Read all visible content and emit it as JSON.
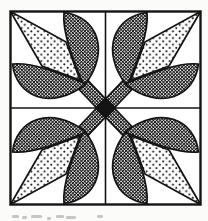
{
  "illustration": {
    "kind": "quilt-block-pattern-figure",
    "motifs": "4 diagonal tulips",
    "flower_texture": "stippled-dots",
    "leaf_stem_texture": "crosshatch",
    "center_shape": "solid-black-diamond"
  },
  "colors": {
    "ink": "#141414",
    "paper": "#fbfbf9",
    "blockfill": "#ffffff",
    "captioncolor": "#b9b9b4"
  },
  "caption_marks": [
    {
      "x": 12,
      "y": 215,
      "w": 7
    },
    {
      "x": 22,
      "y": 216,
      "w": 5
    },
    {
      "x": 31,
      "y": 215,
      "w": 11
    },
    {
      "x": 47,
      "y": 217,
      "w": 4
    },
    {
      "x": 56,
      "y": 215,
      "w": 8
    },
    {
      "x": 66,
      "y": 216,
      "w": 10
    },
    {
      "x": 97,
      "y": 215,
      "w": 6
    }
  ]
}
